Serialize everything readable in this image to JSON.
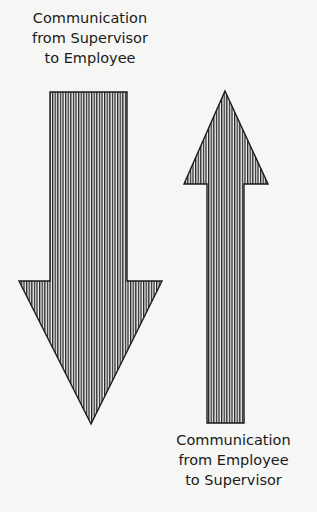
{
  "diagram": {
    "down_arrow": {
      "label_lines": [
        "Communication",
        "from Supervisor",
        "to Employee"
      ],
      "direction": "down"
    },
    "up_arrow": {
      "label_lines": [
        "Communication",
        "from Employee",
        "to Supervisor"
      ],
      "direction": "up"
    },
    "colors": {
      "stroke": "#1a1a1a",
      "hatch": "#222222",
      "background": "#f6f6f4"
    }
  }
}
